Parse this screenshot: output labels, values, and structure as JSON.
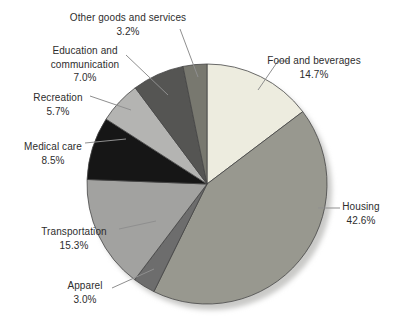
{
  "figure": {
    "background_color": "#ffffff",
    "width": 398,
    "height": 324
  },
  "chart_data": {
    "type": "pie",
    "title": "",
    "units": "%",
    "order": "clockwise from 12 o'clock",
    "legend": "none (direct labels with leader lines)",
    "categories": [
      "Food and beverages",
      "Housing",
      "Apparel",
      "Transportation",
      "Medical care",
      "Recreation",
      "Education and communication",
      "Other goods and services"
    ],
    "values": [
      14.7,
      42.6,
      3.0,
      15.3,
      8.5,
      5.7,
      7.0,
      3.2
    ],
    "slices": [
      {
        "id": "food",
        "label": "Food and beverages",
        "label_lines": [
          "Food and beverages"
        ],
        "value": 14.7,
        "value_label": "14.7%",
        "color": "#edecdf"
      },
      {
        "id": "housing",
        "label": "Housing",
        "label_lines": [
          "Housing"
        ],
        "value": 42.6,
        "value_label": "42.6%",
        "color": "#98988f"
      },
      {
        "id": "apparel",
        "label": "Apparel",
        "label_lines": [
          "Apparel"
        ],
        "value": 3.0,
        "value_label": "3.0%",
        "color": "#6d6d6d"
      },
      {
        "id": "transportation",
        "label": "Transportation",
        "label_lines": [
          "Transportation"
        ],
        "value": 15.3,
        "value_label": "15.3%",
        "color": "#a2a2a0"
      },
      {
        "id": "medical",
        "label": "Medical care",
        "label_lines": [
          "Medical care"
        ],
        "value": 8.5,
        "value_label": "8.5%",
        "color": "#161616"
      },
      {
        "id": "recreation",
        "label": "Recreation",
        "label_lines": [
          "Recreation"
        ],
        "value": 5.7,
        "value_label": "5.7%",
        "color": "#b4b4b2"
      },
      {
        "id": "education",
        "label": "Education and communication",
        "label_lines": [
          "Education and",
          "communication"
        ],
        "value": 7.0,
        "value_label": "7.0%",
        "color": "#555553"
      },
      {
        "id": "other",
        "label": "Other goods and services",
        "label_lines": [
          "Other goods and services"
        ],
        "value": 3.2,
        "value_label": "3.2%",
        "color": "#78786f"
      }
    ],
    "style": {
      "outline_color": "#454545",
      "leader_line_color": "#8f8f8f",
      "text_color": "#2d2d2d",
      "shadow_color": "#c9c9c7"
    }
  }
}
